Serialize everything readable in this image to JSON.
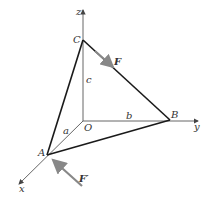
{
  "diagram": {
    "title": "",
    "axes": {
      "x": "x",
      "y": "y",
      "z": "z"
    },
    "points": {
      "O": "O",
      "A": "A",
      "B": "B",
      "C": "C"
    },
    "dimensions": {
      "a": "a",
      "b": "b",
      "c": "c"
    },
    "forces": {
      "F": "F",
      "F_prime": "F′"
    },
    "colors": {
      "edge": "#1a1a1a",
      "axis": "#555555",
      "force": "#888888"
    }
  }
}
